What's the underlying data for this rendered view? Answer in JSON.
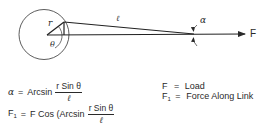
{
  "diagram": {
    "labels": {
      "crank_radius": "r",
      "crank_angle": "θ",
      "link_length": "ℓ",
      "link_angle": "α",
      "load": "F"
    }
  },
  "equations": {
    "alpha": {
      "lhs": "α",
      "op": "=",
      "func": "Arcsin",
      "numerator": "r Sin θ",
      "denominator": "ℓ"
    },
    "f1": {
      "lhs": "F",
      "lhs_sub": "1",
      "op": "=",
      "rhs_prefix": "F Cos (Arcsin",
      "numerator": "r Sin θ",
      "denominator": "ℓ"
    }
  },
  "legend": [
    {
      "symbol": "F",
      "sub": "",
      "op": "=",
      "meaning": "Load"
    },
    {
      "symbol": "F",
      "sub": "1",
      "op": "=",
      "meaning": "Force Along Link"
    }
  ],
  "colors": {
    "ink": "#2a2a2a",
    "background": "#ffffff"
  }
}
